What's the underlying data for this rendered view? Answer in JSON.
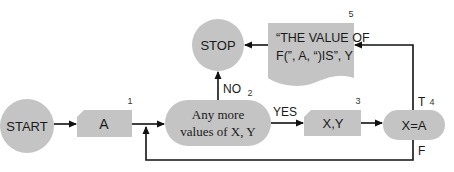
{
  "colors": {
    "shape_fill": "#c4c4c4",
    "line": "#111111",
    "text": "#1a1a1a",
    "background": "#ffffff"
  },
  "nodes": {
    "start": {
      "label": "START",
      "shape": "circle"
    },
    "input_a": {
      "label": "A",
      "number": "1",
      "shape": "card"
    },
    "decision": {
      "line1": "Any more",
      "line2": "values of X,  Y",
      "number": "2",
      "shape": "rounded"
    },
    "stop": {
      "label": "STOP",
      "shape": "circle"
    },
    "input_xy": {
      "label": "X,Y",
      "number": "3",
      "shape": "card"
    },
    "test": {
      "label": "X=A",
      "number": "4",
      "shape": "rounded"
    },
    "output": {
      "line1": "“THE VALUE OF",
      "line2": "F(”, A,  “)IS”, Y",
      "number": "5",
      "shape": "document"
    }
  },
  "edges": {
    "no_label": "NO",
    "yes_label": "YES",
    "true_label": "T",
    "false_label": "F"
  }
}
